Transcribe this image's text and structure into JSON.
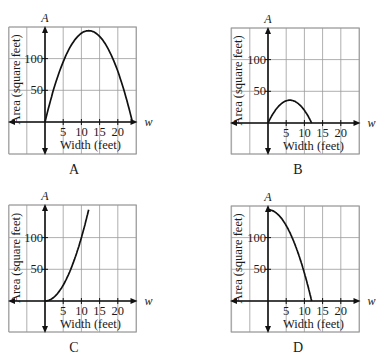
{
  "figure": {
    "axis_labels": {
      "y_var": "A",
      "x_var": "w",
      "y_title": "Area (square feet)",
      "x_title": "Width (feet)"
    },
    "x_ticks": [
      "5",
      "10",
      "15",
      "20"
    ],
    "y_ticks": [
      "50",
      "100"
    ],
    "colors": {
      "grid": "#9a9a9a",
      "axis": "#111111",
      "curve": "#111111"
    }
  },
  "chart_data": [
    {
      "id": "A",
      "caption": "A",
      "type": "line",
      "title": "",
      "xlabel": "Width (feet)",
      "ylabel": "Area (square feet)",
      "xlim": [
        -10,
        25
      ],
      "ylim": [
        -50,
        150
      ],
      "grid": true,
      "x_ticks": [
        5,
        10,
        15,
        20
      ],
      "y_ticks": [
        50,
        100
      ],
      "formula": "A = w(24 - w)",
      "x": [
        0,
        2,
        4,
        6,
        8,
        10,
        12,
        14,
        16,
        18,
        20,
        22,
        24
      ],
      "y": [
        0,
        44,
        80,
        108,
        128,
        140,
        144,
        140,
        128,
        108,
        80,
        44,
        0
      ]
    },
    {
      "id": "B",
      "caption": "B",
      "type": "line",
      "title": "",
      "xlabel": "Width (feet)",
      "ylabel": "Area (square feet)",
      "xlim": [
        -10,
        25
      ],
      "ylim": [
        -50,
        150
      ],
      "grid": true,
      "x_ticks": [
        5,
        10,
        15,
        20
      ],
      "y_ticks": [
        50,
        100
      ],
      "formula": "A = w(12 - w)",
      "x": [
        0,
        1,
        2,
        3,
        4,
        5,
        6,
        7,
        8,
        9,
        10,
        11,
        12
      ],
      "y": [
        0,
        11,
        20,
        27,
        32,
        35,
        36,
        35,
        32,
        27,
        20,
        11,
        0
      ]
    },
    {
      "id": "C",
      "caption": "C",
      "type": "line",
      "title": "",
      "xlabel": "Width (feet)",
      "ylabel": "Area (square feet)",
      "xlim": [
        -10,
        25
      ],
      "ylim": [
        -50,
        150
      ],
      "grid": true,
      "x_ticks": [
        5,
        10,
        15,
        20
      ],
      "y_ticks": [
        50,
        100
      ],
      "formula": "A = w^2",
      "x": [
        0,
        2,
        4,
        6,
        8,
        10,
        11,
        12
      ],
      "y": [
        0,
        4,
        16,
        36,
        64,
        100,
        121,
        144
      ]
    },
    {
      "id": "D",
      "caption": "D",
      "type": "line",
      "title": "",
      "xlabel": "Width (feet)",
      "ylabel": "Area (square feet)",
      "xlim": [
        -10,
        25
      ],
      "ylim": [
        -50,
        150
      ],
      "grid": true,
      "x_ticks": [
        5,
        10,
        15,
        20
      ],
      "y_ticks": [
        50,
        100
      ],
      "formula": "A = 144 - w^2",
      "x": [
        0,
        2,
        4,
        6,
        8,
        10,
        11,
        12
      ],
      "y": [
        144,
        140,
        128,
        108,
        80,
        44,
        23,
        0
      ]
    }
  ]
}
